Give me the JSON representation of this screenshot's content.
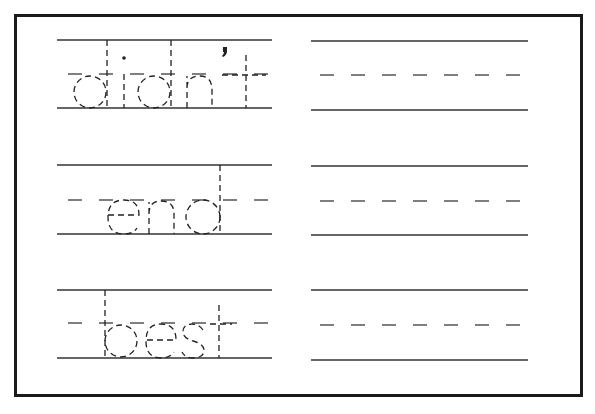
{
  "worksheet": {
    "type": "handwriting-tracing",
    "words": [
      {
        "word": "didn't",
        "letters": [
          "d",
          "i",
          "d",
          "n",
          "'",
          "t"
        ]
      },
      {
        "word": "end",
        "letters": [
          "e",
          "n",
          "d"
        ]
      },
      {
        "word": "best",
        "letters": [
          "b",
          "e",
          "s",
          "t"
        ]
      }
    ],
    "rows": [
      {
        "trace_word": "didn't",
        "practice_blank": true
      },
      {
        "trace_word": "end",
        "practice_blank": true
      },
      {
        "trace_word": "best",
        "practice_blank": true
      }
    ],
    "colors": {
      "border": "#1a1a1a",
      "lines": "#333333",
      "trace": "#222222",
      "background": "#ffffff"
    }
  }
}
